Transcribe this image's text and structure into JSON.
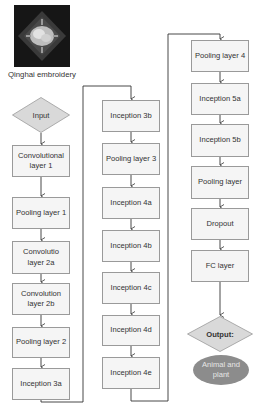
{
  "diagram": {
    "type": "flowchart",
    "input_image": {
      "icon": "embroidery-photo",
      "caption": "Qinghai embroidery"
    },
    "input_node": {
      "label": "Input",
      "fill": "#d9d9d9"
    },
    "columns": [
      {
        "nodes": [
          {
            "label": "Convolutional layer 1"
          },
          {
            "label": "Pooling layer 1"
          },
          {
            "label": "Convolutio layer 2a"
          },
          {
            "label": "Convolution layer 2b"
          },
          {
            "label": "Pooling layer 2"
          },
          {
            "label": "Inception 3a"
          }
        ]
      },
      {
        "nodes": [
          {
            "label": "Inception 3b"
          },
          {
            "label": "Pooling layer 3"
          },
          {
            "label": "Inception 4a"
          },
          {
            "label": "Inception 4b"
          },
          {
            "label": "Inception 4c"
          },
          {
            "label": "Inception 4d"
          },
          {
            "label": "Inception 4e"
          }
        ]
      },
      {
        "nodes": [
          {
            "label": "Pooling layer 4"
          },
          {
            "label": "Inception 5a"
          },
          {
            "label": "Inception 5b"
          },
          {
            "label": "Pooling layer"
          },
          {
            "label": "Dropout"
          },
          {
            "label": "FC layer"
          }
        ]
      }
    ],
    "output_node": {
      "label": "Output:",
      "fill": "#d9d9d9"
    },
    "result_node": {
      "label": "Animal and plant",
      "fill": "#8c8c8c"
    },
    "colors": {
      "box_fill": "#f5f5f5",
      "box_border": "#9a9a9a",
      "line": "#333333"
    }
  }
}
